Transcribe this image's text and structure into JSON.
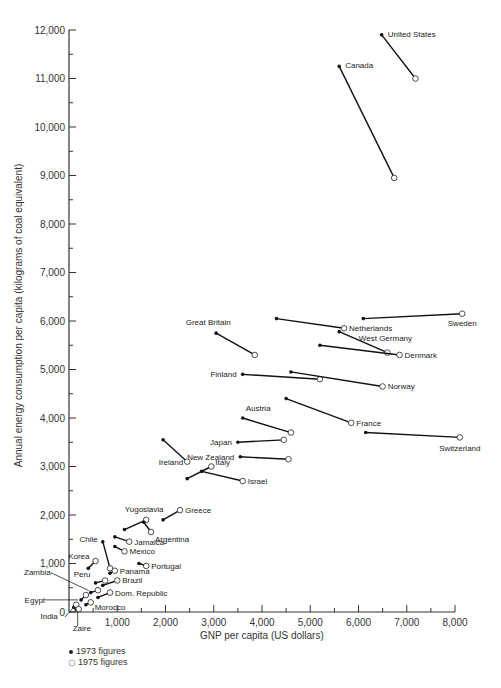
{
  "chart_data": {
    "type": "scatter",
    "title": "",
    "xlabel": "GNP per capita (US dollars)",
    "ylabel": "Annual energy consumption per capita (kilograms of coal equivalent)",
    "xlim": [
      0,
      8000
    ],
    "ylim": [
      0,
      12000
    ],
    "xticks": [
      "1,000",
      "2,000",
      "3,000",
      "4,000",
      "5,000",
      "6,000",
      "7,000",
      "8,000"
    ],
    "yticks": [
      "0",
      "1,000",
      "2,000",
      "3,000",
      "4,000",
      "5,000",
      "6,000",
      "7,000",
      "8,000",
      "9,000",
      "10,000",
      "11,000",
      "12,000"
    ],
    "grid": false,
    "legend": [
      {
        "marker": "filled-dot",
        "label": "1973 figures"
      },
      {
        "marker": "open-circle",
        "label": "1975 figures"
      }
    ],
    "series": [
      {
        "name": "United States",
        "x1973": 6480,
        "y1973": 11900,
        "x1975": 7180,
        "y1975": 11000
      },
      {
        "name": "Canada",
        "x1973": 5600,
        "y1973": 11250,
        "x1975": 6740,
        "y1975": 8950
      },
      {
        "name": "Sweden",
        "x1973": 6100,
        "y1973": 6050,
        "x1975": 8150,
        "y1975": 6150
      },
      {
        "name": "Netherlands",
        "x1973": 4300,
        "y1973": 6050,
        "x1975": 5700,
        "y1975": 5850
      },
      {
        "name": "West Germany",
        "x1973": 5600,
        "y1973": 5780,
        "x1975": 6600,
        "y1975": 5350
      },
      {
        "name": "Denmark",
        "x1973": 5200,
        "y1973": 5500,
        "x1975": 6850,
        "y1975": 5300
      },
      {
        "name": "Great Britain",
        "x1973": 3050,
        "y1973": 5750,
        "x1975": 3850,
        "y1975": 5300
      },
      {
        "name": "Finland",
        "x1973": 3600,
        "y1973": 4900,
        "x1975": 5200,
        "y1975": 4800
      },
      {
        "name": "Norway",
        "x1973": 4600,
        "y1973": 4950,
        "x1975": 6500,
        "y1975": 4650
      },
      {
        "name": "France",
        "x1973": 4500,
        "y1973": 4400,
        "x1975": 5850,
        "y1975": 3900
      },
      {
        "name": "Switzerland",
        "x1973": 6150,
        "y1973": 3700,
        "x1975": 8100,
        "y1975": 3600
      },
      {
        "name": "Austria",
        "x1973": 3600,
        "y1973": 4000,
        "x1975": 4600,
        "y1975": 3700
      },
      {
        "name": "Japan",
        "x1973": 3500,
        "y1973": 3500,
        "x1975": 4450,
        "y1975": 3550
      },
      {
        "name": "New Zealand",
        "x1973": 3550,
        "y1973": 3200,
        "x1975": 4550,
        "y1975": 3150
      },
      {
        "name": "Ireland",
        "x1973": 1950,
        "y1973": 3550,
        "x1975": 2450,
        "y1975": 3100
      },
      {
        "name": "Italy",
        "x1973": 2450,
        "y1973": 2750,
        "x1975": 2950,
        "y1975": 3000
      },
      {
        "name": "Israel",
        "x1973": 2750,
        "y1973": 2900,
        "x1975": 3600,
        "y1975": 2700
      },
      {
        "name": "Greece",
        "x1973": 1950,
        "y1973": 1900,
        "x1975": 2300,
        "y1975": 2100
      },
      {
        "name": "Yugoslavia",
        "x1973": 1150,
        "y1973": 1700,
        "x1975": 1600,
        "y1975": 1900
      },
      {
        "name": "Argentina",
        "x1973": 1550,
        "y1973": 1850,
        "x1975": 1700,
        "y1975": 1650
      },
      {
        "name": "Jamaica",
        "x1973": 950,
        "y1973": 1550,
        "x1975": 1250,
        "y1975": 1450
      },
      {
        "name": "Mexico",
        "x1973": 950,
        "y1973": 1350,
        "x1975": 1150,
        "y1975": 1250
      },
      {
        "name": "Chile",
        "x1973": 700,
        "y1973": 1450,
        "x1975": 850,
        "y1975": 900
      },
      {
        "name": "Portugal",
        "x1973": 1450,
        "y1973": 1000,
        "x1975": 1600,
        "y1975": 950
      },
      {
        "name": "Panama",
        "x1973": 850,
        "y1973": 800,
        "x1975": 950,
        "y1975": 850
      },
      {
        "name": "Korea",
        "x1973": 400,
        "y1973": 900,
        "x1975": 550,
        "y1975": 1050
      },
      {
        "name": "Peru",
        "x1973": 550,
        "y1973": 600,
        "x1975": 750,
        "y1975": 650
      },
      {
        "name": "Brazil",
        "x1973": 700,
        "y1973": 550,
        "x1975": 1000,
        "y1975": 650
      },
      {
        "name": "Zambia",
        "x1973": 450,
        "y1973": 400,
        "x1975": 600,
        "y1975": 450
      },
      {
        "name": "Dom. Republic",
        "x1973": 600,
        "y1973": 300,
        "x1975": 850,
        "y1975": 400
      },
      {
        "name": "Egypt",
        "x1973": 250,
        "y1973": 250,
        "x1975": 350,
        "y1975": 350
      },
      {
        "name": "Morocco",
        "x1973": 350,
        "y1973": 150,
        "x1975": 450,
        "y1975": 200
      },
      {
        "name": "India",
        "x1973": 100,
        "y1973": 100,
        "x1975": 150,
        "y1975": 150
      },
      {
        "name": "Zaire",
        "x1973": 150,
        "y1973": 50,
        "x1975": 200,
        "y1975": 60
      }
    ]
  },
  "labels": {
    "xlabel": "GNP per capita (US dollars)",
    "ylabel": "Annual energy consumption per capita (kilograms of coal equivalent)",
    "legend_1973": "1973 figures",
    "legend_1975": "1975 figures"
  }
}
